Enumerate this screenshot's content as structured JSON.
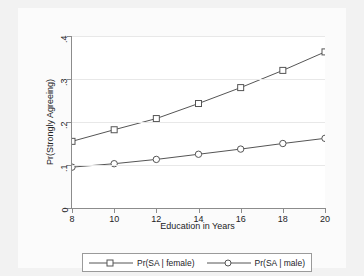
{
  "chart_data": {
    "type": "line",
    "title": "",
    "xlabel": "Education in Years",
    "ylabel": "Pr(Strongly Agreeing)",
    "x": [
      8,
      10,
      12,
      14,
      16,
      18,
      20
    ],
    "xlim": [
      8,
      20
    ],
    "ylim": [
      0,
      0.4
    ],
    "xticks": [
      "8",
      "10",
      "12",
      "14",
      "16",
      "18",
      "20"
    ],
    "yticks": [
      "0",
      ".1",
      ".2",
      ".3",
      ".4"
    ],
    "ytick_values": [
      0,
      0.1,
      0.2,
      0.3,
      0.4
    ],
    "grid": "horizontal",
    "legend_position": "bottom",
    "series": [
      {
        "name": "Pr(SA | female)",
        "marker": "square",
        "color": "#555555",
        "values": [
          0.155,
          0.182,
          0.208,
          0.243,
          0.28,
          0.32,
          0.363
        ]
      },
      {
        "name": "Pr(SA | male)",
        "marker": "circle",
        "color": "#555555",
        "values": [
          0.095,
          0.103,
          0.113,
          0.125,
          0.137,
          0.15,
          0.162
        ]
      }
    ]
  },
  "legend": {
    "entries": [
      {
        "label": "Pr(SA | female)",
        "marker": "square-marker"
      },
      {
        "label": "Pr(SA | male)",
        "marker": "circle-marker"
      }
    ]
  },
  "axes": {
    "x_title": "Education in Years",
    "y_title": "Pr(Strongly Agreeing)"
  }
}
